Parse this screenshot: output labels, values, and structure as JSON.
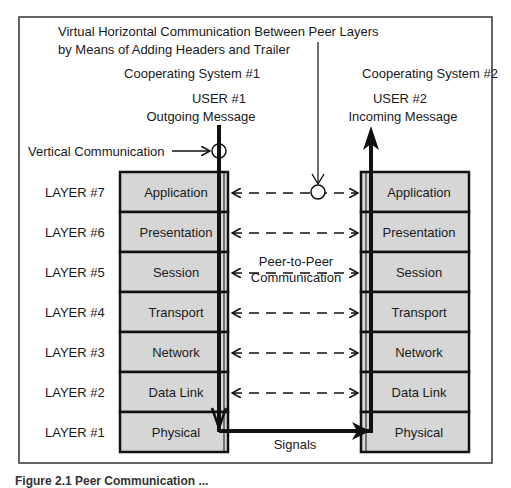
{
  "title_line1": "Virtual Horizontal Communication Between Peer Layers",
  "title_line2": "by Means of Adding Headers and Trailer",
  "system1": {
    "label": "Cooperating System #1",
    "user": "USER #1",
    "message": "Outgoing Message"
  },
  "system2": {
    "label": "Cooperating System #2",
    "user": "USER #2",
    "message": "Incoming Message"
  },
  "vertical_label": "Vertical Communication",
  "peer_label_line1": "Peer-to-Peer",
  "peer_label_line2": "Communication",
  "signals_label": "Signals",
  "layers": [
    {
      "number": "LAYER #7",
      "name": "Application"
    },
    {
      "number": "LAYER #6",
      "name": "Presentation"
    },
    {
      "number": "LAYER #5",
      "name": "Session"
    },
    {
      "number": "LAYER #4",
      "name": "Transport"
    },
    {
      "number": "LAYER #3",
      "name": "Network"
    },
    {
      "number": "LAYER #2",
      "name": "Data Link"
    },
    {
      "number": "LAYER #1",
      "name": "Physical"
    }
  ],
  "caption": "Figure 2.1  Peer Communication ...",
  "colors": {
    "layer_fill": "#d6d6d6",
    "stroke": "#111111"
  }
}
